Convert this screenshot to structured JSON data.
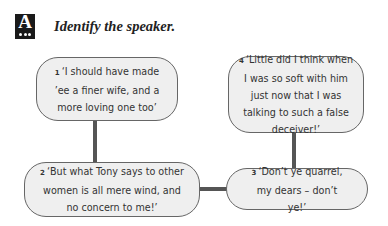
{
  "header": {
    "icon_letter": "A",
    "icon": "activity-a-icon",
    "title": "Identify the speaker."
  },
  "bubbles": [
    {
      "number": "1",
      "text": "‘I should have made ’ee a finer wife, and a more loving one too’"
    },
    {
      "number": "2",
      "text": "‘But what Tony says to other women is all mere wind, and no concern to me!’"
    },
    {
      "number": "3",
      "text": "‘Don’t ye quarrel, my dears – don’t ye!’"
    },
    {
      "number": "4",
      "text": "‘Little did I think when I was so soft with him just now that I was talking to such a false deceiver!’"
    }
  ],
  "colors": {
    "bubble_fill": "#efefef",
    "bubble_border": "#666666",
    "connector": "#555555",
    "icon_bg": "#1a1a1a"
  }
}
